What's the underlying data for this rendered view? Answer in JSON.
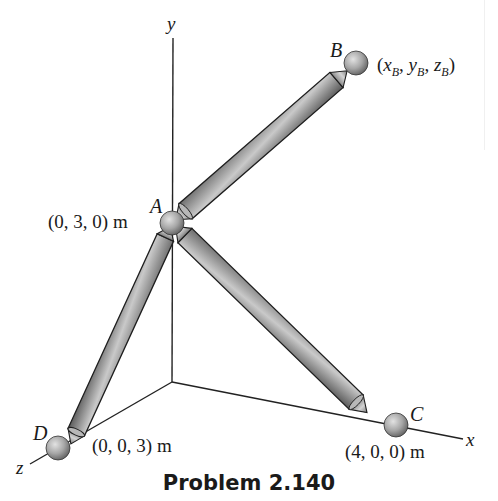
{
  "figure": {
    "caption": "Problem 2.140",
    "axes": {
      "x_label": "x",
      "y_label": "y",
      "z_label": "z"
    },
    "points": {
      "A": {
        "label": "A",
        "coords": "(0, 3, 0) m"
      },
      "B": {
        "label": "B",
        "coords_prefix": "(",
        "x": "x",
        "y": "y",
        "z": "z",
        "sub": "B",
        "sep": ", ",
        "suffix": ")"
      },
      "C": {
        "label": "C",
        "coords": "(4, 0, 0) m"
      },
      "D": {
        "label": "D",
        "coords": "(0, 0, 3) m"
      }
    },
    "members": [
      {
        "name": "AB",
        "from": "A",
        "to": "B"
      },
      {
        "name": "AC",
        "from": "A",
        "to": "C"
      },
      {
        "name": "AD",
        "from": "A",
        "to": "D"
      }
    ],
    "colors": {
      "rod_fill": "#9a9a9a",
      "rod_outline": "#1e1e1e",
      "ball_fill": "#a8a8a8",
      "axis": "#222222"
    }
  }
}
